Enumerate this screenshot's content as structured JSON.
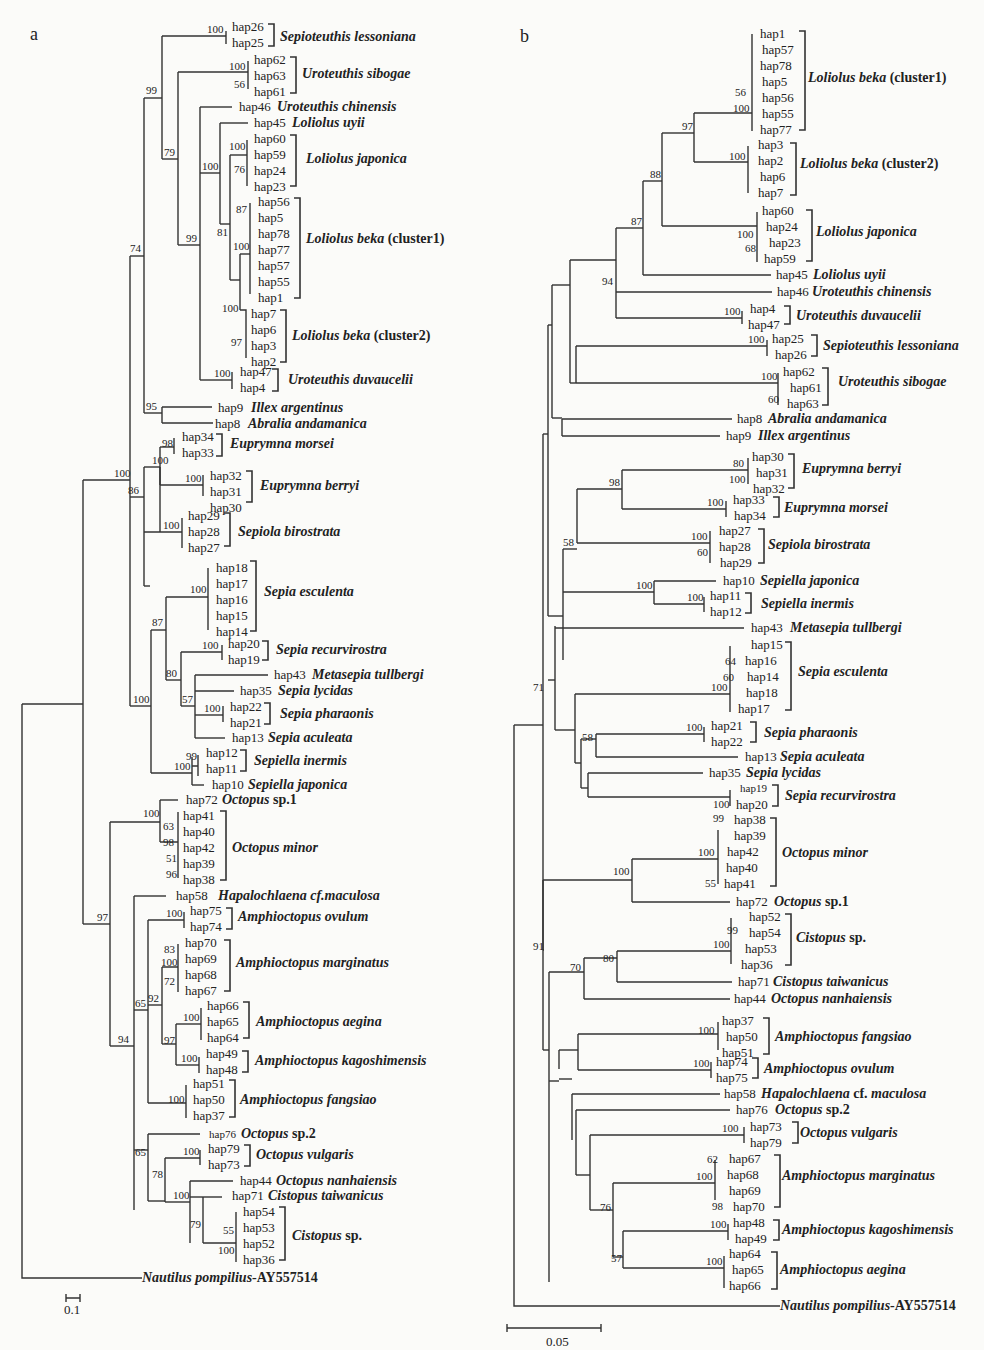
{
  "figure": {
    "panel_a": {
      "label": "a",
      "scale_bar": "0.1",
      "outgroup": {
        "name": "Nautilus pompilius",
        "accession": "-AY557514"
      },
      "bootstraps": {
        "n1": "100",
        "n2": "100",
        "n3": "56",
        "n4": "99",
        "n5": "79",
        "n6": "100",
        "n7": "76",
        "n8": "87",
        "n9": "81",
        "n10": "100",
        "n11": "99",
        "n12": "100",
        "n13": "97",
        "n14": "100",
        "n15": "74",
        "n16": "95",
        "n17": "98",
        "n18": "100",
        "n19": "100",
        "n20": "100",
        "n21": "86",
        "n22": "100",
        "n23": "100",
        "n24": "87",
        "n25": "100",
        "n26": "80",
        "n27": "57",
        "n28": "100",
        "n29": "99",
        "n30": "100",
        "n31": "100",
        "n32": "100",
        "n33": "63",
        "n34": "98",
        "n35": "51",
        "n36": "96",
        "n37": "97",
        "n38": "100",
        "n39": "83",
        "n40": "100",
        "n41": "72",
        "n42": "92",
        "n43": "65",
        "n44": "100",
        "n45": "97",
        "n46": "100",
        "n47": "94",
        "n48": "100",
        "n49": "65",
        "n50": "100",
        "n51": "78",
        "n52": "100",
        "n53": "79",
        "n54": "55",
        "n55": "100"
      },
      "clades": [
        {
          "haps": [
            "hap26",
            "hap25"
          ],
          "species": "Sepioteuthis lessoniana",
          "suffix": ""
        },
        {
          "haps": [
            "hap62",
            "hap63",
            "hap61"
          ],
          "species": "Uroteuthis sibogae",
          "suffix": ""
        },
        {
          "haps": [
            "hap46"
          ],
          "species": "Uroteuthis  chinensis",
          "suffix": ""
        },
        {
          "haps": [
            "hap45"
          ],
          "species": "Loliolus  uyii",
          "suffix": ""
        },
        {
          "haps": [
            "hap60",
            "hap59",
            "hap24",
            "hap23"
          ],
          "species": "Loliolus  japonica",
          "suffix": ""
        },
        {
          "haps": [
            "hap56",
            "hap5",
            "hap78",
            "hap77",
            "hap57",
            "hap55",
            "hap1"
          ],
          "species": "Loliolus beka",
          "suffix": " (cluster1)"
        },
        {
          "haps": [
            "hap7",
            "hap6",
            "hap3",
            "hap2"
          ],
          "species": "Loliolus beka",
          "suffix": " (cluster2)"
        },
        {
          "haps": [
            "hap47",
            "hap4"
          ],
          "species": "Uroteuthis duvaucelii",
          "suffix": ""
        },
        {
          "haps": [
            "hap9"
          ],
          "species": "Illex argentinus",
          "suffix": ""
        },
        {
          "haps": [
            "hap8"
          ],
          "species": "Abralia andamanica",
          "suffix": ""
        },
        {
          "haps": [
            "hap34",
            "hap33"
          ],
          "species": "Euprymna morsei",
          "suffix": ""
        },
        {
          "haps": [
            "hap32",
            "hap31",
            "hap30"
          ],
          "species": "Euprymna berryi",
          "suffix": ""
        },
        {
          "haps": [
            "hap29",
            "hap28",
            "hap27"
          ],
          "species": "Sepiola birostrata",
          "suffix": ""
        },
        {
          "haps": [
            "hap18",
            "hap17",
            "hap16",
            "hap15",
            "hap14"
          ],
          "species": "Sepia esculenta",
          "suffix": ""
        },
        {
          "haps": [
            "hap20",
            "hap19"
          ],
          "species": "Sepia recurvirostra",
          "suffix": ""
        },
        {
          "haps": [
            "hap43"
          ],
          "species": "Metasepia tullbergi",
          "suffix": ""
        },
        {
          "haps": [
            "hap35"
          ],
          "species": "Sepia lycidas",
          "suffix": ""
        },
        {
          "haps": [
            "hap22",
            "hap21"
          ],
          "species": "Sepia pharaonis",
          "suffix": ""
        },
        {
          "haps": [
            "hap13"
          ],
          "species": "Sepia aculeata",
          "suffix": ""
        },
        {
          "haps": [
            "hap12",
            "hap11"
          ],
          "species": "Sepiella inermis",
          "suffix": ""
        },
        {
          "haps": [
            "hap10"
          ],
          "species": "Sepiella japonica",
          "suffix": ""
        },
        {
          "haps": [
            "hap72"
          ],
          "species": "Octopus",
          "suffix": " sp.1"
        },
        {
          "haps": [
            "hap41",
            "hap40",
            "hap42",
            "hap39",
            "hap38"
          ],
          "species": "Octopus minor",
          "suffix": ""
        },
        {
          "haps": [
            "hap58"
          ],
          "species": "Hapalochlaena cf.maculosa",
          "suffix": ""
        },
        {
          "haps": [
            "hap75",
            "hap74"
          ],
          "species": "Amphioctopus ovulum",
          "suffix": ""
        },
        {
          "haps": [
            "hap70",
            "hap69",
            "hap68",
            "hap67"
          ],
          "species": "Amphioctopus marginatus",
          "suffix": ""
        },
        {
          "haps": [
            "hap66",
            "hap65",
            "hap64"
          ],
          "species": "Amphioctopus aegina",
          "suffix": ""
        },
        {
          "haps": [
            "hap49",
            "hap48"
          ],
          "species": "Amphioctopus kagoshimensis",
          "suffix": ""
        },
        {
          "haps": [
            "hap51",
            "hap50",
            "hap37"
          ],
          "species": "Amphioctopus fangsiao",
          "suffix": ""
        },
        {
          "haps": [
            "hap76"
          ],
          "species": "Octopus",
          "suffix": " sp.2"
        },
        {
          "haps": [
            "hap79",
            "hap73"
          ],
          "species": "Octopus vulgaris",
          "suffix": ""
        },
        {
          "haps": [
            "hap44"
          ],
          "species": "Octopus nanhaiensis",
          "suffix": ""
        },
        {
          "haps": [
            "hap71"
          ],
          "species": "Cistopus taiwanicus",
          "suffix": ""
        },
        {
          "haps": [
            "hap54",
            "hap53",
            "hap52",
            "hap36"
          ],
          "species": "Cistopus",
          "suffix": " sp."
        }
      ]
    },
    "panel_b": {
      "label": "b",
      "scale_bar": "0.05",
      "outgroup": {
        "name": "Nautilus pompilius",
        "accession": "-AY557514"
      },
      "bootstraps": {
        "n1": "56",
        "n2": "100",
        "n3": "97",
        "n4": "100",
        "n5": "88",
        "n6": "100",
        "n7": "68",
        "n8": "87",
        "n9": "94",
        "n10": "100",
        "n11": "100",
        "n12": "100",
        "n13": "60",
        "n14": "80",
        "n15": "100",
        "n16": "98",
        "n17": "100",
        "n18": "71",
        "n19": "100",
        "n20": "60",
        "n21": "58",
        "n22": "100",
        "n23": "100",
        "n24": "64",
        "n25": "60",
        "n26": "100",
        "n27": "100",
        "n28": "58",
        "n29": "100",
        "n30": "99",
        "n31": "100",
        "n32": "55",
        "n33": "100",
        "n34": "99",
        "n35": "100",
        "n36": "80",
        "n37": "70",
        "n38": "91",
        "n39": "100",
        "n40": "100",
        "n41": "100",
        "n42": "62",
        "n43": "100",
        "n44": "98",
        "n45": "76",
        "n46": "100",
        "n47": "100",
        "n48": "57"
      },
      "clades": [
        {
          "haps": [
            "hap1",
            "hap57",
            "hap78",
            "hap5",
            "hap56",
            "hap55",
            "hap77"
          ],
          "species": "Loliolus beka",
          "suffix": " (cluster1)"
        },
        {
          "haps": [
            "hap3",
            "hap2",
            "hap6",
            "hap7"
          ],
          "species": "Loliolus beka",
          "suffix": " (cluster2)"
        },
        {
          "haps": [
            "hap60",
            "hap24",
            "hap23",
            "hap59"
          ],
          "species": "Loliolus  japonica",
          "suffix": ""
        },
        {
          "haps": [
            "hap45"
          ],
          "species": "Loliolus  uyii",
          "suffix": ""
        },
        {
          "haps": [
            "hap46"
          ],
          "species": "Uroteuthis  chinensis",
          "suffix": ""
        },
        {
          "haps": [
            "hap4",
            "hap47"
          ],
          "species": "Uroteuthis duvaucelii",
          "suffix": ""
        },
        {
          "haps": [
            "hap25",
            "hap26"
          ],
          "species": "Sepioteuthis lessoniana",
          "suffix": ""
        },
        {
          "haps": [
            "hap62",
            "hap61",
            "hap63"
          ],
          "species": "Uroteuthis sibogae",
          "suffix": ""
        },
        {
          "haps": [
            "hap8"
          ],
          "species": "Abralia andamanica",
          "suffix": ""
        },
        {
          "haps": [
            "hap9"
          ],
          "species": "Illex argentinus",
          "suffix": ""
        },
        {
          "haps": [
            "hap30",
            "hap31",
            "hap32"
          ],
          "species": "Euprymna berryi",
          "suffix": ""
        },
        {
          "haps": [
            "hap33",
            "hap34"
          ],
          "species": "Euprymna morsei",
          "suffix": ""
        },
        {
          "haps": [
            "hap27",
            "hap28",
            "hap29"
          ],
          "species": "Sepiola birostrata",
          "suffix": ""
        },
        {
          "haps": [
            "hap10"
          ],
          "species": "Sepiella japonica",
          "suffix": ""
        },
        {
          "haps": [
            "hap11",
            "hap12"
          ],
          "species": "Sepiella inermis",
          "suffix": ""
        },
        {
          "haps": [
            "hap43"
          ],
          "species": "Metasepia tullbergi",
          "suffix": ""
        },
        {
          "haps": [
            "hap15",
            "hap16",
            "hap14",
            "hap18",
            "hap17"
          ],
          "species": "Sepia esculenta",
          "suffix": ""
        },
        {
          "haps": [
            "hap21",
            "hap22"
          ],
          "species": "Sepia pharaonis",
          "suffix": ""
        },
        {
          "haps": [
            "hap13"
          ],
          "species": "Sepia aculeata",
          "suffix": ""
        },
        {
          "haps": [
            "hap35"
          ],
          "species": "Sepia lycidas",
          "suffix": ""
        },
        {
          "haps": [
            "hap19",
            "hap20"
          ],
          "species": "Sepia recurvirostra",
          "suffix": ""
        },
        {
          "haps": [
            "hap38",
            "hap39",
            "hap42",
            "hap40",
            "hap41"
          ],
          "species": "Octopus minor",
          "suffix": ""
        },
        {
          "haps": [
            "hap72"
          ],
          "species": "Octopus",
          "suffix": " sp.1"
        },
        {
          "haps": [
            "hap52",
            "hap54",
            "hap53",
            "hap36"
          ],
          "species": "Cistopus",
          "suffix": " sp."
        },
        {
          "haps": [
            "hap71"
          ],
          "species": "Cistopus taiwanicus",
          "suffix": ""
        },
        {
          "haps": [
            "hap44"
          ],
          "species": "Octopus nanhaiensis",
          "suffix": ""
        },
        {
          "haps": [
            "hap37",
            "hap50",
            "hap51"
          ],
          "species": "Amphioctopus fangsiao",
          "suffix": ""
        },
        {
          "haps": [
            "hap74",
            "hap75"
          ],
          "species": "Amphioctopus ovulum",
          "suffix": ""
        },
        {
          "haps": [
            "hap58"
          ],
          "species": "Hapalochlaena",
          "suffix": " cf. ",
          "suffix2": "maculosa"
        },
        {
          "haps": [
            "hap76"
          ],
          "species": "Octopus",
          "suffix": " sp.2"
        },
        {
          "haps": [
            "hap73",
            "hap79"
          ],
          "species": "Octopus vulgaris",
          "suffix": ""
        },
        {
          "haps": [
            "hap67",
            "hap68",
            "hap69",
            "hap70"
          ],
          "species": "Amphioctopus marginatus",
          "suffix": ""
        },
        {
          "haps": [
            "hap48",
            "hap49"
          ],
          "species": "Amphioctopus kagoshimensis",
          "suffix": ""
        },
        {
          "haps": [
            "hap64",
            "hap65",
            "hap66"
          ],
          "species": "Amphioctopus aegina",
          "suffix": ""
        }
      ]
    }
  }
}
